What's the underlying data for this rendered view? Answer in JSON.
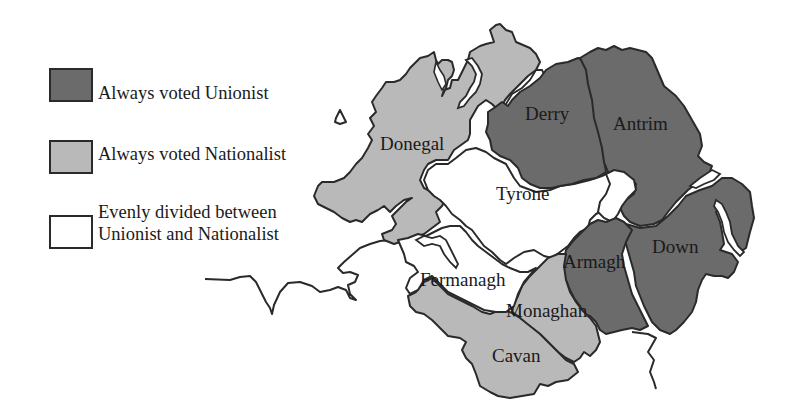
{
  "legend": {
    "items": [
      {
        "label": "Always voted Unionist",
        "color": "#6b6b6b",
        "key": "unionist"
      },
      {
        "label": "Always voted Nationalist",
        "color": "#b9b9b9",
        "key": "nationalist"
      },
      {
        "label_line1": "Evenly divided between",
        "label_line2": "Unionist and Nationalist",
        "color": "#ffffff",
        "key": "divided"
      }
    ]
  },
  "colors": {
    "unionist": "#6b6b6b",
    "nationalist": "#b9b9b9",
    "divided": "#ffffff",
    "outline": "#2a2a2a"
  },
  "counties": [
    {
      "name": "Donegal",
      "category": "nationalist"
    },
    {
      "name": "Derry",
      "category": "unionist"
    },
    {
      "name": "Antrim",
      "category": "unionist"
    },
    {
      "name": "Tyrone",
      "category": "divided"
    },
    {
      "name": "Fermanagh",
      "category": "divided"
    },
    {
      "name": "Armagh",
      "category": "unionist"
    },
    {
      "name": "Down",
      "category": "unionist"
    },
    {
      "name": "Monaghan",
      "category": "nationalist"
    },
    {
      "name": "Cavan",
      "category": "nationalist"
    }
  ]
}
